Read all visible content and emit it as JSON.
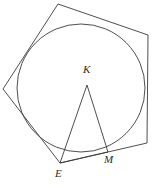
{
  "figure": {
    "kind": "geometry-diagram",
    "canvas": {
      "width": 155,
      "height": 187
    },
    "colors": {
      "background": "#ffffff",
      "stroke": "#3a3a3a",
      "label": "#2b2b2b"
    },
    "circle": {
      "name": "inscribed-circle",
      "cx": 81,
      "cy": 88,
      "r": 64
    },
    "polygon": {
      "name": "circumscribed-pentagon",
      "sides": 5,
      "points": "58,4 148,35 147,143 60,163 3,89",
      "vertices": [
        {
          "label": "",
          "x": 58,
          "y": 4
        },
        {
          "label": "",
          "x": 148,
          "y": 35
        },
        {
          "label": "",
          "x": 147,
          "y": 143
        },
        {
          "label": "E",
          "x": 60,
          "y": 163
        },
        {
          "label": "",
          "x": 3,
          "y": 89
        }
      ]
    },
    "triangle": {
      "name": "triangle-kem",
      "points": "87,85 60,163 108,152",
      "vertices": [
        {
          "label": "K",
          "x": 87,
          "y": 85
        },
        {
          "label": "E",
          "x": 60,
          "y": 163
        },
        {
          "label": "M",
          "x": 108,
          "y": 152
        }
      ]
    },
    "labels": [
      {
        "id": "label-k",
        "text": "K",
        "x": 83,
        "y": 64
      },
      {
        "id": "label-e",
        "text": "E",
        "x": 55,
        "y": 168
      },
      {
        "id": "label-m",
        "text": "M",
        "x": 104,
        "y": 154
      }
    ]
  }
}
